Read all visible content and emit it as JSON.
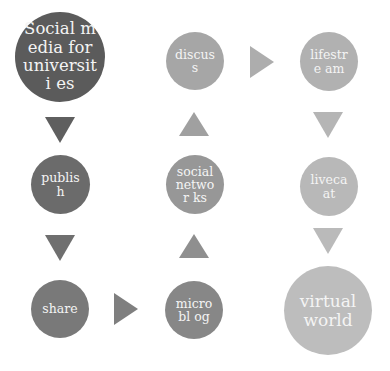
{
  "diagram": {
    "nodes": [
      {
        "id": "social-media",
        "label": "Social media for universities",
        "color": "#5b5b5b"
      },
      {
        "id": "publish",
        "label": "publish",
        "color": "#6b6b6b"
      },
      {
        "id": "share",
        "label": "share",
        "color": "#797979"
      },
      {
        "id": "microblog",
        "label": "microblog",
        "color": "#878787"
      },
      {
        "id": "social-networks",
        "label": "social networks",
        "color": "#979797"
      },
      {
        "id": "discuss",
        "label": "discuss",
        "color": "#a6a6a6"
      },
      {
        "id": "lifestream",
        "label": "lifestream",
        "color": "#b1b1b1"
      },
      {
        "id": "livecast",
        "label": "livecaat",
        "color": "#b8b8b8"
      },
      {
        "id": "virtual-world",
        "label": "virtual world",
        "color": "#bdbdbd"
      }
    ],
    "display_labels": {
      "social-media": "Social media for universiti es",
      "publish": "publish",
      "share": "share",
      "microblog": "microbl og",
      "social-networks": "social networ ks",
      "discuss": "discuss",
      "lifestream": "lifestre am",
      "livecast": "livecaat",
      "virtual-world": "virtual world"
    },
    "arrows": [
      {
        "from": "social-media",
        "to": "publish",
        "direction": "down",
        "color": "#5f5f5f"
      },
      {
        "from": "publish",
        "to": "share",
        "direction": "down",
        "color": "#6f6f6f"
      },
      {
        "from": "share",
        "to": "microblog",
        "direction": "right",
        "color": "#7f7f7f"
      },
      {
        "from": "microblog",
        "to": "social-networks",
        "direction": "up",
        "color": "#8f8f8f"
      },
      {
        "from": "social-networks",
        "to": "discuss",
        "direction": "up",
        "color": "#a0a0a0"
      },
      {
        "from": "discuss",
        "to": "lifestream",
        "direction": "right",
        "color": "#adadad"
      },
      {
        "from": "lifestream",
        "to": "livecast",
        "direction": "down",
        "color": "#b5b5b5"
      },
      {
        "from": "livecast",
        "to": "virtual-world",
        "direction": "down",
        "color": "#bababa"
      }
    ]
  }
}
